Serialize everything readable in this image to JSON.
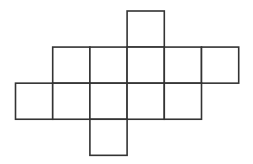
{
  "diagram": {
    "type": "grid-net-of-squares",
    "stroke_color": "#333333",
    "fill_color": "#ffffff",
    "background": "#ffffff",
    "stroke_width": 1.6,
    "origin": {
      "x": 15.5,
      "y": 11
    },
    "cell_size": 37.2,
    "rows": [
      {
        "row": 0,
        "cols": [
          3
        ]
      },
      {
        "row": 1,
        "cols": [
          1,
          2,
          3,
          4,
          5
        ]
      },
      {
        "row": 2,
        "cols": [
          0,
          1,
          2,
          3,
          4
        ]
      },
      {
        "row": 3,
        "cols": [
          2
        ]
      }
    ],
    "square_count": 12
  }
}
